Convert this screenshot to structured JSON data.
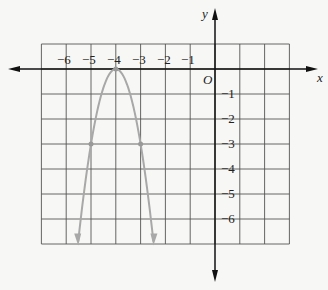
{
  "figure": {
    "type": "coordinate-plane-graph",
    "axes": {
      "x_label": "x",
      "y_label": "y",
      "origin_label": "O",
      "x_tick_labels": [
        "−6",
        "−5",
        "−4",
        "−3",
        "−2",
        "−1"
      ],
      "y_tick_labels": [
        "−1",
        "−2",
        "−3",
        "−4",
        "−5",
        "−6"
      ]
    },
    "grid": {
      "x_range": [
        -7,
        3
      ],
      "y_range": [
        -7,
        1
      ],
      "step": 1
    },
    "curve": {
      "kind": "parabola",
      "equation": "y = -3(x + 4)^2",
      "vertex": [
        -4,
        0
      ],
      "marked_points": [
        [
          -5,
          -3
        ],
        [
          -3,
          -3
        ]
      ],
      "opens": "down",
      "color": "#a8a8a8"
    },
    "colors": {
      "grid": "#555555",
      "axis": "#111111",
      "background": "#f7f7f5"
    }
  }
}
